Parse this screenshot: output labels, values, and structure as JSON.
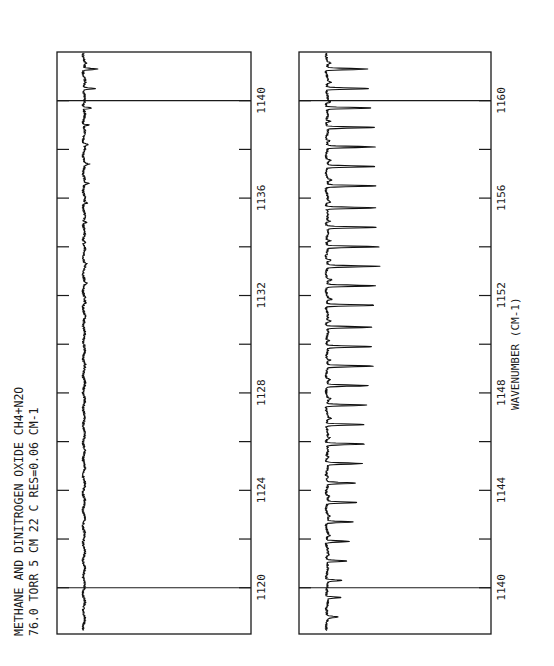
{
  "chart_data": [
    {
      "type": "line",
      "title": "METHANE AND DINITROGEN OXIDE   CH4+N2O",
      "subtitle": "76.0  TORR   5 CM   22 C             RES=0.06 CM-1",
      "xlabel": "",
      "ylabel": "Absorbance",
      "orientation": "rotated-90",
      "xlim": [
        1118.1,
        1142.0
      ],
      "xticks": [
        1120,
        1122,
        1124,
        1126,
        1128,
        1130,
        1132,
        1134,
        1136,
        1138,
        1140
      ],
      "xtick_labels": [
        "1120",
        "1124",
        "1128",
        "1132",
        "1136",
        "1140"
      ],
      "grid_lines": [
        1120,
        1140
      ],
      "baseline": 0,
      "peaks": [
        {
          "x": 1141.3,
          "y": 0.22
        },
        {
          "x": 1140.5,
          "y": 0.19
        },
        {
          "x": 1139.7,
          "y": 0.15
        },
        {
          "x": 1139.0,
          "y": 0.09
        },
        {
          "x": 1138.2,
          "y": 0.08
        },
        {
          "x": 1137.4,
          "y": 0.07
        },
        {
          "x": 1136.6,
          "y": 0.06
        },
        {
          "x": 1135.8,
          "y": 0.06
        },
        {
          "x": 1135.0,
          "y": 0.05
        },
        {
          "x": 1134.2,
          "y": 0.04
        },
        {
          "x": 1133.3,
          "y": 0.04
        },
        {
          "x": 1132.5,
          "y": 0.03
        },
        {
          "x": 1131.7,
          "y": 0.03
        },
        {
          "x": 1130.9,
          "y": 0.02
        },
        {
          "x": 1130.0,
          "y": 0.02
        },
        {
          "x": 1129.2,
          "y": 0.02
        },
        {
          "x": 1128.4,
          "y": 0.01
        }
      ]
    },
    {
      "type": "line",
      "title": "",
      "xlabel": "WAVENUMBER (CM-1)",
      "ylabel": "Absorbance",
      "orientation": "rotated-90",
      "xlim": [
        1138.1,
        1162.0
      ],
      "xticks": [
        1140,
        1142,
        1144,
        1146,
        1148,
        1150,
        1152,
        1154,
        1156,
        1158,
        1160
      ],
      "xtick_labels": [
        "1140",
        "1144",
        "1148",
        "1152",
        "1156",
        "1160"
      ],
      "grid_lines": [
        1140,
        1160
      ],
      "baseline": 0,
      "peaks": [
        {
          "x": 1161.3,
          "y": 0.7
        },
        {
          "x": 1160.5,
          "y": 0.74
        },
        {
          "x": 1159.7,
          "y": 0.78
        },
        {
          "x": 1158.9,
          "y": 0.82
        },
        {
          "x": 1158.1,
          "y": 0.82
        },
        {
          "x": 1157.3,
          "y": 0.82
        },
        {
          "x": 1156.5,
          "y": 0.84
        },
        {
          "x": 1155.6,
          "y": 0.84
        },
        {
          "x": 1154.8,
          "y": 0.85
        },
        {
          "x": 1154.0,
          "y": 0.9
        },
        {
          "x": 1153.2,
          "y": 0.9
        },
        {
          "x": 1152.4,
          "y": 0.84
        },
        {
          "x": 1151.6,
          "y": 0.84
        },
        {
          "x": 1150.7,
          "y": 0.8
        },
        {
          "x": 1149.9,
          "y": 0.76
        },
        {
          "x": 1149.1,
          "y": 0.78
        },
        {
          "x": 1148.3,
          "y": 0.72
        },
        {
          "x": 1147.5,
          "y": 0.7
        },
        {
          "x": 1146.7,
          "y": 0.64
        },
        {
          "x": 1145.9,
          "y": 0.66
        },
        {
          "x": 1145.1,
          "y": 0.6
        },
        {
          "x": 1144.3,
          "y": 0.48
        },
        {
          "x": 1143.5,
          "y": 0.5
        },
        {
          "x": 1142.7,
          "y": 0.44
        },
        {
          "x": 1141.9,
          "y": 0.4
        },
        {
          "x": 1141.1,
          "y": 0.36
        },
        {
          "x": 1140.3,
          "y": 0.26
        },
        {
          "x": 1139.6,
          "y": 0.24
        },
        {
          "x": 1138.8,
          "y": 0.18
        }
      ]
    }
  ],
  "header": {
    "line1": "METHANE AND DINITROGEN OXIDE   CH4+N2O",
    "line2": "76.0  TORR   5 CM   22 C             RES=0.06 CM-1"
  },
  "axis": {
    "xlabel": "WAVENUMBER (CM-1)"
  },
  "colors": {
    "ink": "#1a1a1a",
    "background": "#ffffff"
  }
}
